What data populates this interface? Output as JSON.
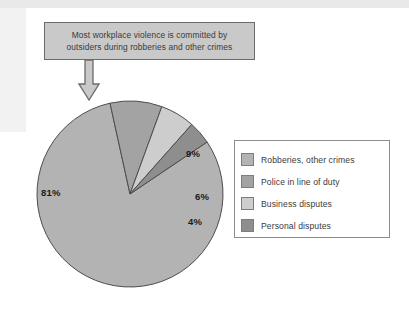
{
  "callout": {
    "lines": [
      "Most workplace violence is committed by",
      "outsiders during robberies and other crimes"
    ],
    "arrow_icon": "down-arrow-icon",
    "fill_color": "#c9c9c9",
    "border_color": "#6b6b6b"
  },
  "chart_data": {
    "type": "pie",
    "title": "",
    "categories": [
      "Robberies, other crimes",
      "Police in line of duty",
      "Business disputes",
      "Personal disputes"
    ],
    "values": [
      81,
      9,
      6,
      4
    ],
    "value_labels": [
      "81%",
      "9%",
      "6%",
      "4%"
    ],
    "units": "percent",
    "total": 100,
    "colors": [
      "#b3b3b3",
      "#a3a3a3",
      "#cdcdcd",
      "#8e8e8e"
    ],
    "slice_border_color": "#4d4d4d",
    "start_angle_deg": -34,
    "direction": "clockwise",
    "legend_position": "right",
    "grid": false
  },
  "legend": {
    "items": [
      {
        "label": "Robberies, other crimes",
        "color": "#b3b3b3"
      },
      {
        "label": "Police in line of duty",
        "color": "#a3a3a3"
      },
      {
        "label": "Business disputes",
        "color": "#cdcdcd"
      },
      {
        "label": "Personal disputes",
        "color": "#8e8e8e"
      }
    ],
    "border_color": "#8c8c8c"
  }
}
